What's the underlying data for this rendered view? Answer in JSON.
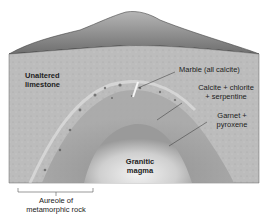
{
  "diagram": {
    "type": "block-diagram",
    "labels": {
      "unaltered_line1": "Unaltered",
      "unaltered_line2": "limestone",
      "marble": "Marble (all calcite)",
      "calcite_line1": "Calcite + chlorite",
      "calcite_line2": "+ serpentine",
      "garnet_line1": "Garnet +",
      "garnet_line2": "pyroxene",
      "granitic_line1": "Granitic",
      "granitic_line2": "magma",
      "aureole_line1": "Aureole of",
      "aureole_line2": "metamorphic rock"
    },
    "colors": {
      "mountain": "#7f7f7f",
      "limestone": "#bdbdbd",
      "aureole": "#9a9a9a",
      "magma": "#d8d8d8",
      "leader_line": "#333333"
    }
  }
}
